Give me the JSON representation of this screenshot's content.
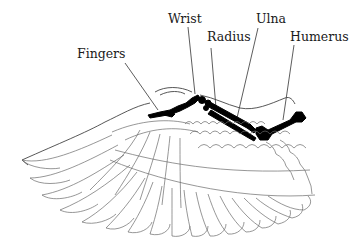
{
  "diagram": {
    "labels": {
      "fingers": "Fingers",
      "wrist": "Wrist",
      "radius": "Radius",
      "ulna": "Ulna",
      "humerus": "Humerus"
    },
    "colors": {
      "bone": "#000000",
      "feather_line": "#6a6a6a",
      "label_text": "#1a1a1a",
      "background": "#ffffff"
    }
  }
}
